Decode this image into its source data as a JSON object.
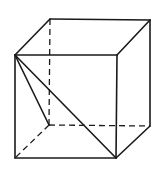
{
  "diagram": {
    "type": "hand-drawn-cube-wireframe",
    "stroke_color": "#1a1a1a",
    "background": "#ffffff",
    "vertices": {
      "front_top_left": [
        15,
        55
      ],
      "front_top_right": [
        117,
        55
      ],
      "front_bottom_left": [
        15,
        158
      ],
      "front_bottom_right": [
        116,
        158
      ],
      "back_top_left": [
        50,
        19
      ],
      "back_top_right": [
        150,
        20
      ],
      "back_bottom_left": [
        49,
        125
      ],
      "back_bottom_right": [
        150,
        126
      ]
    },
    "solid_edges": [
      [
        "front_top_left",
        "front_top_right"
      ],
      [
        "front_top_right",
        "front_bottom_right"
      ],
      [
        "front_bottom_right",
        "front_bottom_left"
      ],
      [
        "front_bottom_left",
        "front_top_left"
      ],
      [
        "front_top_left",
        "back_top_left"
      ],
      [
        "back_top_left",
        "back_top_right"
      ],
      [
        "back_top_right",
        "front_top_right"
      ],
      [
        "back_top_right",
        "back_bottom_right"
      ],
      [
        "back_bottom_right",
        "front_bottom_right"
      ],
      [
        "front_top_left",
        "front_bottom_right"
      ],
      [
        "front_top_left",
        "back_bottom_left"
      ]
    ],
    "dashed_edges": [
      [
        "back_top_left",
        "back_bottom_left"
      ],
      [
        "back_bottom_left",
        "back_bottom_right"
      ],
      [
        "back_bottom_left",
        "front_bottom_left"
      ]
    ]
  }
}
